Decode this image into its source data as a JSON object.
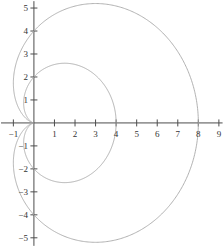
{
  "figure": {
    "name": "polar-cardioid-plot",
    "background_color": "#ffffff",
    "curve_color": "#a8a8a8",
    "axis_color": "#4d4d4d",
    "label_color": "#333333",
    "width": 223,
    "height": 247
  },
  "chart_data": {
    "type": "line",
    "title": "",
    "subtitle": "",
    "xlabel": "",
    "ylabel": "",
    "grid": false,
    "legend": null,
    "legend_position": "none",
    "xlim": [
      -1.65,
      9.2
    ],
    "ylim": [
      -5.4,
      5.35
    ],
    "x_ticks": [
      -1,
      1,
      2,
      3,
      4,
      5,
      6,
      7,
      8,
      9
    ],
    "x_tick_labels": [
      "−1",
      "1",
      "2",
      "3",
      "4",
      "5",
      "6",
      "7",
      "8",
      "9"
    ],
    "y_ticks": [
      -5,
      -4,
      -3,
      -2,
      -1,
      1,
      2,
      3,
      4,
      5
    ],
    "y_tick_labels": [
      "−5",
      "−4",
      "−3",
      "−2",
      "−1",
      "1",
      "2",
      "3",
      "4",
      "5"
    ],
    "origin_label": "",
    "series": [
      {
        "name": "outer-cardioid",
        "equation": "r = 4(1 + cos θ)",
        "color": "#a8a8a8",
        "a": 4,
        "x_intercept": 8,
        "y_intercepts": [
          2,
          -2
        ],
        "max_y": 4.6,
        "min_y": -4.6,
        "max_y_at_x": 3.0,
        "cusp": [
          0,
          0
        ]
      },
      {
        "name": "inner-cardioid",
        "equation": "r = 2(1 + cos θ)",
        "color": "#a8a8a8",
        "a": 2,
        "x_intercept": 4,
        "y_intercepts": [
          1,
          -1
        ],
        "max_y": 2.3,
        "min_y": -2.3,
        "max_y_at_x": 1.5,
        "cusp": [
          0,
          0
        ]
      }
    ]
  }
}
